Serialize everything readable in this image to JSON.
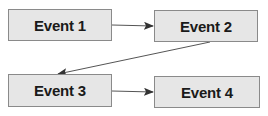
{
  "diagram": {
    "type": "flowchart",
    "nodes": [
      {
        "id": "event1",
        "label": "Event 1"
      },
      {
        "id": "event2",
        "label": "Event 2"
      },
      {
        "id": "event3",
        "label": "Event 3"
      },
      {
        "id": "event4",
        "label": "Event 4"
      }
    ],
    "edges": [
      {
        "from": "event1",
        "to": "event2"
      },
      {
        "from": "event2",
        "to": "event3"
      },
      {
        "from": "event3",
        "to": "event4"
      }
    ],
    "colors": {
      "box_fill": "#e6e6e6",
      "box_border": "#8a8a8a",
      "arrow": "#333333",
      "text": "#1a1a1a"
    }
  }
}
